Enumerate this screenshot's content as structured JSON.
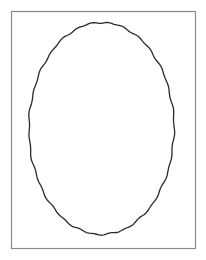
{
  "figure": {
    "width": 206,
    "height": 260,
    "background": "#ffffff",
    "frame": {
      "x": 11,
      "y": 11,
      "width": 184,
      "height": 237,
      "stroke": "#8a8a8a",
      "stroke_width": 1.2
    },
    "ellipse": {
      "cx": 101.5,
      "cy": 128.5,
      "rx": 72.5,
      "ry": 106,
      "stroke": "#2a2a2a",
      "stroke_width": 1.3,
      "fill": "none",
      "style": "hand-drawn"
    }
  }
}
